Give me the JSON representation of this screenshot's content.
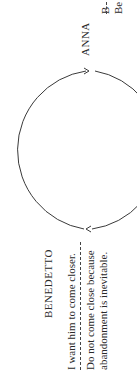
{
  "diagram": {
    "type": "cycle",
    "orientation": "rotated-90-ccw",
    "nodes": [
      {
        "id": "anna",
        "name": "ANNA",
        "lines": [
          "B",
          "Be"
        ]
      },
      {
        "id": "benedetto",
        "name": "BENEDETTO",
        "lines": [
          "I want him to come closer.",
          "Do not come close because",
          "abandonment is inevitable."
        ]
      }
    ],
    "edges": [
      {
        "from": "benedetto",
        "to": "anna",
        "arrow": "top"
      },
      {
        "from": "anna",
        "to": "benedetto",
        "arrow": "bottom"
      }
    ],
    "colors": {
      "stroke": "#3a3a3a",
      "text": "#2a2a2a",
      "background": "#ffffff"
    }
  }
}
